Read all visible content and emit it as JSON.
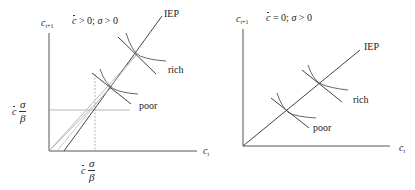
{
  "panels": [
    {
      "id": "left",
      "y_axis_label": "c",
      "y_axis_sub": "t+1",
      "x_axis_label": "c",
      "x_axis_sub": "t",
      "condition": {
        "c_sym": "c",
        "rel1": " > 0; ",
        "sigma": "σ",
        "rel2": " > 0"
      },
      "line_label": "IEP",
      "curve_labels": {
        "rich": "rich",
        "poor": "poor"
      },
      "threshold_label": {
        "c_sym": "c",
        "num": "σ",
        "den": "β"
      }
    },
    {
      "id": "right",
      "y_axis_label": "c",
      "y_axis_sub": "t+1",
      "x_axis_label": "c",
      "x_axis_sub": "t",
      "condition": {
        "c_sym": "c",
        "rel1": " = 0; ",
        "sigma": "σ",
        "rel2": " > 0"
      },
      "line_label": "IEP",
      "curve_labels": {
        "rich": "rich",
        "poor": "poor"
      }
    }
  ],
  "colors": {
    "axis": "#555555",
    "line": "#444444",
    "dotted": "#888888",
    "text": "#222222"
  }
}
